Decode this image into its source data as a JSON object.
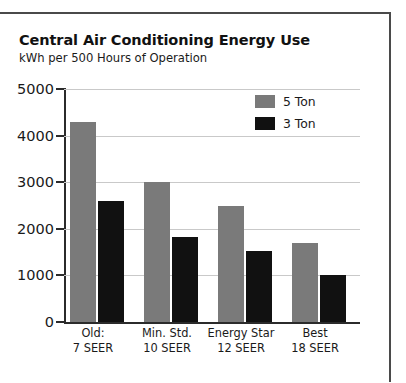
{
  "chart_data": {
    "type": "bar",
    "title": "Central Air Conditioning Energy Use",
    "subtitle": "kWh per 500 Hours of Operation",
    "xlabel": "",
    "ylabel": "",
    "ylim": [
      0,
      5000
    ],
    "yticks": [
      0,
      1000,
      2000,
      3000,
      4000,
      5000
    ],
    "ytick_labels": [
      "0",
      "1000",
      "2000",
      "3000",
      "4000",
      "5000"
    ],
    "grid": true,
    "legend_position": "top-right",
    "categories": [
      "Old:\n7 SEER",
      "Min. Std.\n10 SEER",
      "Energy Star\n12 SEER",
      "Best\n18 SEER"
    ],
    "category_lines": [
      [
        "Old:",
        "7 SEER"
      ],
      [
        "Min. Std.",
        "10 SEER"
      ],
      [
        "Energy Star",
        "12 SEER"
      ],
      [
        "Best",
        "18 SEER"
      ]
    ],
    "series": [
      {
        "name": "5 Ton",
        "color": "#7a7a7a",
        "values": [
          4300,
          3000,
          2500,
          1700
        ]
      },
      {
        "name": "3 Ton",
        "color": "#111111",
        "values": [
          2600,
          1830,
          1530,
          1000
        ]
      }
    ]
  },
  "legend": {
    "items": [
      {
        "label": "5 Ton",
        "color": "#7a7a7a"
      },
      {
        "label": "3 Ton",
        "color": "#111111"
      }
    ]
  }
}
